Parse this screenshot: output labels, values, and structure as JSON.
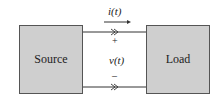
{
  "diagram": {
    "source_label": "Source",
    "load_label": "Load",
    "current_label": "i(t)",
    "voltage_label": "v(t)",
    "plus_sign": "+",
    "minus_sign": "–",
    "box_fill": "#cfcfcf"
  }
}
